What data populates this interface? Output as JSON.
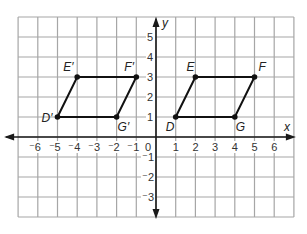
{
  "diagram": {
    "type": "coordinate-plane",
    "x_range": [
      -7,
      7
    ],
    "y_range": [
      -4,
      6
    ],
    "axis_labels": {
      "x": "x",
      "y": "y"
    },
    "x_ticks": [
      {
        "value": -6,
        "label": "⁻6"
      },
      {
        "value": -5,
        "label": "⁻5"
      },
      {
        "value": -4,
        "label": "⁻4"
      },
      {
        "value": -3,
        "label": "⁻3"
      },
      {
        "value": -2,
        "label": "⁻2"
      },
      {
        "value": -1,
        "label": "⁻1"
      },
      {
        "value": 0,
        "label": "0"
      },
      {
        "value": 1,
        "label": "1"
      },
      {
        "value": 2,
        "label": "2"
      },
      {
        "value": 3,
        "label": "3"
      },
      {
        "value": 4,
        "label": "4"
      },
      {
        "value": 5,
        "label": "5"
      },
      {
        "value": 6,
        "label": "6"
      }
    ],
    "y_ticks": [
      {
        "value": 5,
        "label": "5"
      },
      {
        "value": 4,
        "label": "4"
      },
      {
        "value": 3,
        "label": "3"
      },
      {
        "value": 2,
        "label": "2"
      },
      {
        "value": 1,
        "label": "1"
      },
      {
        "value": -1,
        "label": "⁻1"
      },
      {
        "value": -2,
        "label": "⁻2"
      },
      {
        "value": -3,
        "label": "⁻3"
      }
    ],
    "shapes": [
      {
        "name": "DEFG",
        "vertices": [
          {
            "label": "D",
            "x": 1,
            "y": 1,
            "lx": -10,
            "ly": 14
          },
          {
            "label": "E",
            "x": 2,
            "y": 3,
            "lx": -9,
            "ly": -6
          },
          {
            "label": "F",
            "x": 5,
            "y": 3,
            "lx": 4,
            "ly": -6
          },
          {
            "label": "G",
            "x": 4,
            "y": 1,
            "lx": 1,
            "ly": 14
          }
        ]
      },
      {
        "name": "D'E'F'G'",
        "vertices": [
          {
            "label": "D′",
            "x": -5,
            "y": 1,
            "lx": -16,
            "ly": 5
          },
          {
            "label": "E′",
            "x": -4,
            "y": 3,
            "lx": -14,
            "ly": -6
          },
          {
            "label": "F′",
            "x": -1,
            "y": 3,
            "lx": -12,
            "ly": -6
          },
          {
            "label": "G′",
            "x": -2,
            "y": 1,
            "lx": 1,
            "ly": 14
          }
        ]
      }
    ]
  },
  "colors": {
    "grid": "#a6a6a6",
    "axis": "#1a1a1a",
    "shape": "#111111"
  }
}
